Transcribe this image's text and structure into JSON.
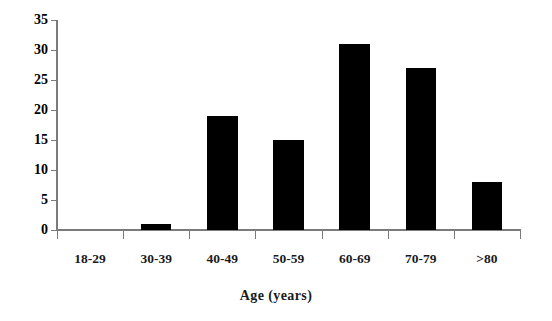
{
  "chart_data": {
    "type": "bar",
    "title": "",
    "subtitle": "",
    "xlabel": "Age (years)",
    "ylabel": "",
    "categories": [
      "18-29",
      "30-39",
      "40-49",
      "50-59",
      "60-69",
      "70-79",
      ">80"
    ],
    "values": [
      0,
      1,
      19,
      15,
      31,
      27,
      8
    ],
    "ylim": [
      0,
      35
    ],
    "ytick_labels": [
      "0",
      "5",
      "10",
      "15",
      "20",
      "25",
      "30",
      "35"
    ],
    "ytick_values": [
      0,
      5,
      10,
      15,
      20,
      25,
      30,
      35
    ],
    "grid": false,
    "legend": null,
    "legend_position": "none",
    "annotations": [],
    "series": [
      {
        "name": "Count",
        "values": [
          0,
          1,
          19,
          15,
          31,
          27,
          8
        ]
      }
    ],
    "colors": {
      "bar_fill": "#000000",
      "axis_line": "#7b7b7b",
      "text": "#1a1a1a",
      "background": "#ffffff"
    }
  }
}
